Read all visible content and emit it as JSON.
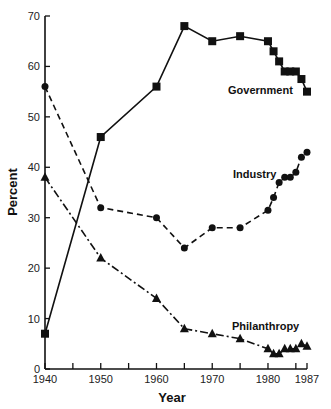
{
  "chart_data": {
    "type": "line",
    "title": "",
    "xlabel": "Year",
    "ylabel": "Percent",
    "xlim": [
      1940,
      1987
    ],
    "ylim": [
      0,
      70
    ],
    "x_ticks": [
      1940,
      1945,
      1950,
      1955,
      1960,
      1965,
      1970,
      1975,
      1980,
      1985,
      1987
    ],
    "x_tick_labels": [
      "1940",
      "1950",
      "1960",
      "1970",
      "1980",
      "1987"
    ],
    "y_ticks": [
      0,
      10,
      20,
      30,
      40,
      50,
      60,
      70
    ],
    "y_tick_labels": [
      "0",
      "10",
      "20",
      "30",
      "40",
      "50",
      "60",
      "70"
    ],
    "grid": false,
    "legend": "inline labels",
    "series": [
      {
        "name": "Government",
        "marker": "square",
        "line_style": "solid",
        "x": [
          1940,
          1950,
          1960,
          1965,
          1970,
          1975,
          1980,
          1981,
          1982,
          1983,
          1984,
          1985,
          1986,
          1987
        ],
        "values": [
          7,
          46,
          56,
          68,
          65,
          66,
          65,
          63,
          61,
          59,
          59,
          59,
          57.5,
          55
        ]
      },
      {
        "name": "Industry",
        "marker": "circle",
        "line_style": "dashed",
        "x": [
          1940,
          1950,
          1960,
          1965,
          1970,
          1975,
          1980,
          1981,
          1982,
          1983,
          1984,
          1985,
          1986,
          1987
        ],
        "values": [
          56,
          32,
          30,
          24,
          28,
          28,
          31.5,
          34,
          37,
          38,
          38,
          39,
          42,
          43
        ]
      },
      {
        "name": "Philanthropy",
        "marker": "triangle",
        "line_style": "dash-dot",
        "x": [
          1940,
          1950,
          1960,
          1965,
          1970,
          1975,
          1980,
          1981,
          1982,
          1983,
          1984,
          1985,
          1986,
          1987
        ],
        "values": [
          38,
          22,
          14,
          8,
          7,
          6,
          4,
          3,
          3,
          4,
          4,
          4,
          5,
          4.5
        ]
      }
    ],
    "annotations": [
      {
        "text": "Government",
        "x": 1976,
        "y": 57
      },
      {
        "text": "Industry",
        "x": 1972,
        "y": 38.5
      },
      {
        "text": "Philanthropy",
        "x": 1974,
        "y": 9
      }
    ]
  },
  "labels": {
    "xlabel": "Year",
    "ylabel": "Percent",
    "government": "Government",
    "industry": "Industry",
    "philanthropy": "Philanthropy"
  },
  "colors": {
    "ink": "#111111",
    "background": "#ffffff"
  }
}
